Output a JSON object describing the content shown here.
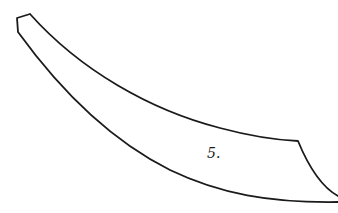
{
  "figure": {
    "label": "5.",
    "stroke_color": "#1a1a1a",
    "background": "#ffffff"
  }
}
